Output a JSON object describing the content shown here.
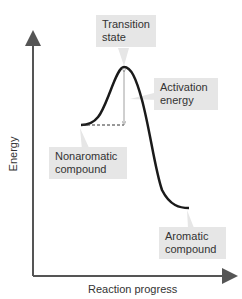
{
  "diagram": {
    "type": "energy-diagram",
    "axes": {
      "y_label": "Energy",
      "x_label": "Reaction progress"
    },
    "labels": {
      "transition_state": [
        "Transition",
        "state"
      ],
      "activation_energy": [
        "Activation",
        "energy"
      ],
      "nonaromatic": [
        "Nonaromatic",
        "compound"
      ],
      "aromatic": [
        "Aromatic",
        "compound"
      ]
    },
    "colors": {
      "curve": "#1a1a1a",
      "axis": "#555555",
      "label_bg": "#e6e6e6"
    }
  }
}
